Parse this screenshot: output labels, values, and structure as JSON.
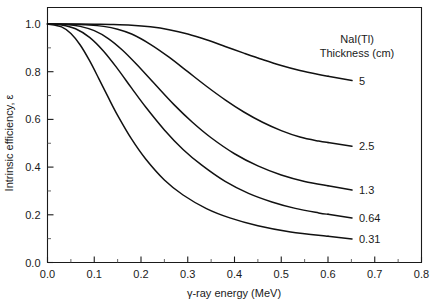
{
  "chart_data": {
    "type": "line",
    "title": "",
    "xlabel": "γ-ray energy (MeV)",
    "ylabel": "Intrinsic efficiency, ε",
    "xlim": [
      0.0,
      0.8
    ],
    "ylim": [
      0.0,
      1.0
    ],
    "xticks": [
      "0.0",
      "0.1",
      "0.2",
      "0.3",
      "0.4",
      "0.5",
      "0.6",
      "0.7",
      "0.8"
    ],
    "xtick_values": [
      0.0,
      0.1,
      0.2,
      0.3,
      0.4,
      0.5,
      0.6,
      0.7,
      0.8
    ],
    "xminor_values": [
      0.05,
      0.15,
      0.25,
      0.35,
      0.45,
      0.55,
      0.65,
      0.75
    ],
    "yticks": [
      "0.0",
      "0.2",
      "0.4",
      "0.6",
      "0.8",
      "1.0"
    ],
    "ytick_values": [
      0.0,
      0.2,
      0.4,
      0.6,
      0.8,
      1.0
    ],
    "yminor_values": [
      0.1,
      0.3,
      0.5,
      0.7,
      0.9
    ],
    "grid": false,
    "legend_position": "inside-right",
    "legend_title_line1": "NaI(Tl)",
    "legend_title_line2": "Thickness (cm)",
    "series": [
      {
        "name": "5",
        "label": "5",
        "x": [
          0.0,
          0.05,
          0.1,
          0.14,
          0.18,
          0.22,
          0.26,
          0.3,
          0.34,
          0.38,
          0.42,
          0.46,
          0.5,
          0.54,
          0.58,
          0.6
        ],
        "values": [
          1.0,
          1.0,
          0.999,
          0.998,
          0.995,
          0.988,
          0.976,
          0.958,
          0.934,
          0.906,
          0.878,
          0.851,
          0.826,
          0.805,
          0.788,
          0.781
        ]
      },
      {
        "name": "2.5",
        "label": "2.5",
        "x": [
          0.0,
          0.05,
          0.09,
          0.12,
          0.15,
          0.18,
          0.22,
          0.26,
          0.3,
          0.34,
          0.38,
          0.42,
          0.46,
          0.5,
          0.54,
          0.58,
          0.6
        ],
        "values": [
          1.0,
          0.999,
          0.996,
          0.99,
          0.978,
          0.958,
          0.915,
          0.861,
          0.8,
          0.739,
          0.682,
          0.631,
          0.588,
          0.553,
          0.526,
          0.509,
          0.503
        ]
      },
      {
        "name": "1.3",
        "label": "1.3",
        "x": [
          0.0,
          0.04,
          0.07,
          0.1,
          0.13,
          0.16,
          0.19,
          0.23,
          0.27,
          0.31,
          0.35,
          0.4,
          0.45,
          0.5,
          0.55,
          0.6
        ],
        "values": [
          1.0,
          0.998,
          0.99,
          0.972,
          0.939,
          0.891,
          0.832,
          0.747,
          0.663,
          0.588,
          0.523,
          0.456,
          0.405,
          0.367,
          0.34,
          0.322
        ]
      },
      {
        "name": "0.64",
        "label": "0.64",
        "x": [
          0.0,
          0.03,
          0.06,
          0.09,
          0.12,
          0.15,
          0.18,
          0.21,
          0.25,
          0.29,
          0.33,
          0.38,
          0.43,
          0.48,
          0.53,
          0.58,
          0.6
        ],
        "values": [
          1.0,
          0.996,
          0.98,
          0.944,
          0.886,
          0.812,
          0.731,
          0.652,
          0.556,
          0.474,
          0.408,
          0.34,
          0.29,
          0.254,
          0.227,
          0.208,
          0.202
        ]
      },
      {
        "name": "0.31",
        "label": "0.31",
        "x": [
          0.0,
          0.03,
          0.05,
          0.07,
          0.09,
          0.11,
          0.13,
          0.15,
          0.18,
          0.21,
          0.25,
          0.29,
          0.34,
          0.39,
          0.45,
          0.52,
          0.6
        ],
        "values": [
          1.0,
          0.988,
          0.96,
          0.912,
          0.846,
          0.77,
          0.692,
          0.617,
          0.517,
          0.434,
          0.346,
          0.283,
          0.226,
          0.187,
          0.154,
          0.128,
          0.11
        ]
      }
    ]
  },
  "colors": {
    "curve": "#111111",
    "axis": "#1a1a1a",
    "background": "#ffffff"
  }
}
